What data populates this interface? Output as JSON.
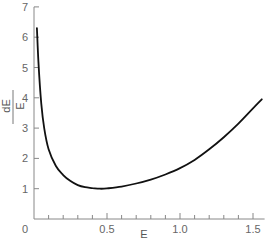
{
  "chart_data": {
    "type": "line",
    "title": "",
    "xlabel": "E",
    "ylabel": {
      "numerator": "dE",
      "denominator": "E"
    },
    "xlim": [
      0,
      1.6
    ],
    "ylim": [
      0,
      7
    ],
    "x_ticks": [
      0.5,
      1.0,
      1.5
    ],
    "x_tick_labels": [
      "0.5",
      "1.0",
      "1.5"
    ],
    "x_minor_tick_step": 0.1,
    "y_ticks": [
      0,
      1,
      2,
      3,
      4,
      5,
      6,
      7
    ],
    "y_tick_labels": [
      "0",
      "1",
      "2",
      "3",
      "4",
      "5",
      "6",
      "7"
    ],
    "grid": false,
    "legend": null,
    "series": [
      {
        "name": "dE/E",
        "x": [
          0.02,
          0.03,
          0.05,
          0.07,
          0.1,
          0.15,
          0.2,
          0.25,
          0.3,
          0.35,
          0.4,
          0.45,
          0.5,
          0.6,
          0.7,
          0.8,
          0.9,
          1.0,
          1.1,
          1.2,
          1.3,
          1.4,
          1.5,
          1.56
        ],
        "values": [
          6.3,
          5.2,
          3.8,
          3.0,
          2.3,
          1.75,
          1.45,
          1.25,
          1.12,
          1.05,
          1.02,
          1.0,
          1.01,
          1.07,
          1.17,
          1.3,
          1.47,
          1.68,
          1.95,
          2.3,
          2.7,
          3.15,
          3.65,
          3.95
        ]
      }
    ]
  }
}
